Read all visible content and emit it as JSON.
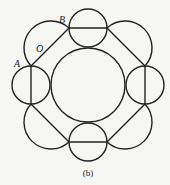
{
  "figure": {
    "caption": "(b)",
    "stroke_color": "#222222",
    "background_color": "#f6f6f3",
    "labels": {
      "A": "A",
      "B": "B",
      "O": "O"
    },
    "central_circle": {
      "cx": 88,
      "cy": 85,
      "r": 37
    },
    "small_circles": [
      {
        "name": "top",
        "cx": 88,
        "cy": 28,
        "r": 19,
        "diameter": "horizontal"
      },
      {
        "name": "right",
        "cx": 145,
        "cy": 85,
        "r": 19,
        "diameter": "vertical"
      },
      {
        "name": "bottom",
        "cx": 88,
        "cy": 142,
        "r": 19,
        "diameter": "horizontal"
      },
      {
        "name": "left",
        "cx": 31,
        "cy": 85,
        "r": 19,
        "diameter": "vertical"
      }
    ],
    "chords": [
      {
        "name": "top-left",
        "from": [
          31,
          66
        ],
        "to": [
          69,
          28
        ]
      },
      {
        "name": "top-right",
        "from": [
          107,
          28
        ],
        "to": [
          145,
          66
        ]
      },
      {
        "name": "bottom-right",
        "from": [
          145,
          104
        ],
        "to": [
          107,
          142
        ]
      },
      {
        "name": "bottom-left",
        "from": [
          69,
          142
        ],
        "to": [
          31,
          104
        ]
      }
    ]
  }
}
